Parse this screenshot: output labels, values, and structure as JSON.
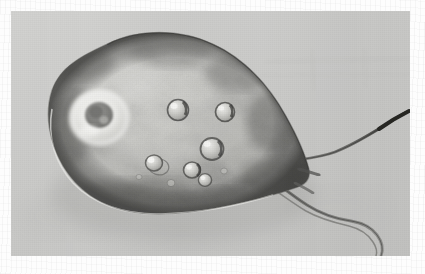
{
  "figure": {
    "domain": "natural-image",
    "kind": "light-microscopy-micrograph",
    "subject_label": "flagellated protozoan cell",
    "alt_text": "Grayscale light micrograph of a single pear-shaped flagellated protozoan cell with a prominent ring-shaped nucleus, several small round vacuoles, and two long trailing flagella.",
    "orientation": "landscape",
    "panel": {
      "left": 11,
      "top": 11,
      "width": 399,
      "height": 245,
      "background_color": "#c9c9c7",
      "border_color": "#bdbdbb"
    },
    "page_background_color": "#fdfdfd"
  },
  "palette": {
    "page_white": "#fdfdfd",
    "panel_gray": "#c9c9c7",
    "panel_gray_light": "#d2d2d0",
    "panel_gray_dark": "#bcbcba",
    "cell_midtone": "#a8a8a4",
    "cell_highlight": "#e4e4e0",
    "cell_shadow": "#6e6e6b",
    "cell_deep_shadow": "#4f4f4d",
    "membrane_rim": "#3f3f3e",
    "nucleus_ring": "#ececea",
    "nucleus_core": "#797976",
    "vacuole_rim": "#5a5a58",
    "vacuole_fill": "#c4c4c0",
    "vacuole_highlight": "#f2f2f0",
    "flagellum_dark": "#4a4a48",
    "flagellum_mid": "#8d8d8a",
    "shadow_cast": "#b2b2b0"
  },
  "structures": [
    {
      "id": "cell-body",
      "name": "cell-body",
      "label": "Cell body",
      "description": "Large pear/ovoid amoeboid body occupying the left two-thirds of the frame, tapering to a posterior point at the right.",
      "center": {
        "x": 166,
        "y": 128
      },
      "approx_width": 255,
      "approx_height": 175,
      "tilt_degrees": -24
    },
    {
      "id": "nucleus",
      "name": "nucleus",
      "label": "Nucleus",
      "description": "Bright halo ring with a darker granular core and a central nucleolus.",
      "center": {
        "x": 100,
        "y": 118
      },
      "outer_radius": 29,
      "inner_radius": 13
    },
    {
      "id": "vacuole-1",
      "name": "vacuole",
      "label": "Vacuole",
      "center": {
        "x": 178,
        "y": 110
      },
      "radius": 11
    },
    {
      "id": "vacuole-2",
      "name": "vacuole",
      "label": "Vacuole",
      "center": {
        "x": 225,
        "y": 112
      },
      "radius": 10
    },
    {
      "id": "vacuole-3",
      "name": "vacuole",
      "label": "Vacuole",
      "center": {
        "x": 212,
        "y": 149
      },
      "radius": 12
    },
    {
      "id": "vacuole-4",
      "name": "vacuole",
      "label": "Vacuole",
      "center": {
        "x": 154,
        "y": 163
      },
      "radius": 9
    },
    {
      "id": "vacuole-5",
      "name": "vacuole",
      "label": "Vacuole",
      "center": {
        "x": 192,
        "y": 170
      },
      "radius": 9
    },
    {
      "id": "vacuole-6",
      "name": "vacuole",
      "label": "Vacuole",
      "center": {
        "x": 205,
        "y": 178
      },
      "radius": 7
    },
    {
      "id": "flagellum-upper",
      "name": "flagellum",
      "label": "Anterior flagellum",
      "description": "Long slender flagellum sweeping up and to the right, thickening to a dark tip at the upper right margin of the panel.",
      "origin": {
        "x": 279,
        "y": 163
      },
      "tip": {
        "x": 409,
        "y": 112
      }
    },
    {
      "id": "flagellum-lower",
      "name": "flagellum",
      "label": "Posterior flagellum",
      "description": "Second flagellum curving down and right, undulating toward the lower right corner of the panel.",
      "origin": {
        "x": 272,
        "y": 180
      },
      "tip": {
        "x": 374,
        "y": 252
      }
    }
  ]
}
